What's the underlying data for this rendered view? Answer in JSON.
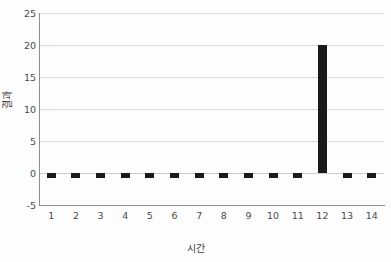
{
  "chart_data": {
    "type": "bar",
    "title": "",
    "xlabel": "시간",
    "ylabel": "결과",
    "categories": [
      "1",
      "2",
      "3",
      "4",
      "5",
      "6",
      "7",
      "8",
      "9",
      "10",
      "11",
      "12",
      "13",
      "14"
    ],
    "values": [
      -0.5,
      -0.5,
      -0.5,
      -0.5,
      -0.5,
      -0.5,
      -0.5,
      -0.5,
      -0.5,
      -0.5,
      -0.5,
      20,
      -0.5,
      -0.5
    ],
    "series": [
      {
        "name": "결과",
        "values": [
          -0.5,
          -0.5,
          -0.5,
          -0.5,
          -0.5,
          -0.5,
          -0.5,
          -0.5,
          -0.5,
          -0.5,
          -0.5,
          20,
          -0.5,
          -0.5
        ]
      }
    ],
    "ylim": [
      -5,
      25
    ],
    "yticks": [
      -5,
      0,
      5,
      10,
      15,
      20,
      25
    ],
    "ytick_labels": [
      "-5",
      "0",
      "5",
      "10",
      "15",
      "20",
      "25"
    ],
    "xtick_labels": [
      "1",
      "2",
      "3",
      "4",
      "5",
      "6",
      "7",
      "8",
      "9",
      "10",
      "11",
      "12",
      "13",
      "14"
    ],
    "grid": true,
    "grid_axis": "y",
    "legend": false,
    "bar_color": "#1a1a1a",
    "grid_color": "#d9d9d9",
    "axis_color": "#8d8d8d",
    "background_color": "#fdfdfd",
    "annotations": []
  }
}
